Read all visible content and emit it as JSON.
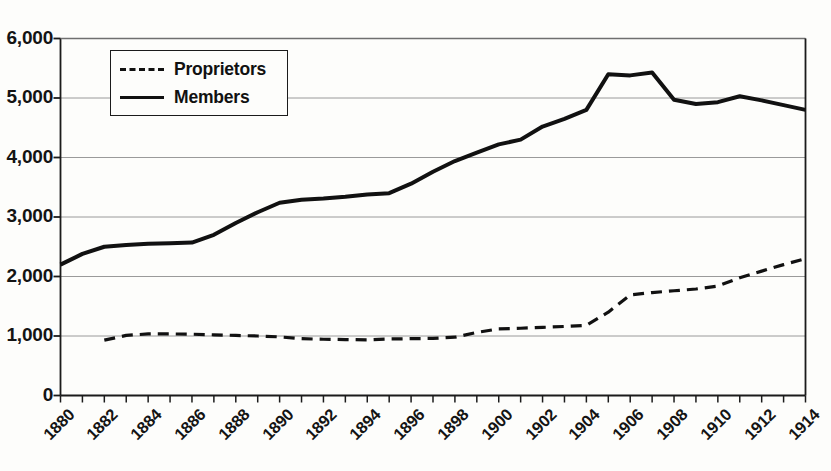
{
  "chart_data": {
    "type": "line",
    "title": "",
    "subtitle": "",
    "xlabel": "",
    "ylabel": "",
    "xlim": [
      1880,
      1914
    ],
    "ylim": [
      0,
      6000
    ],
    "grid": true,
    "grid_axis": "y",
    "legend_position": "upper-left-inside",
    "y_ticks": [
      0,
      1000,
      2000,
      3000,
      4000,
      5000,
      6000
    ],
    "y_tick_labels": [
      "0",
      "1,000",
      "2,000",
      "3,000",
      "4,000",
      "5,000",
      "6,000"
    ],
    "x_ticks": [
      1880,
      1881,
      1882,
      1883,
      1884,
      1885,
      1886,
      1887,
      1888,
      1889,
      1890,
      1891,
      1892,
      1893,
      1894,
      1895,
      1896,
      1897,
      1898,
      1899,
      1900,
      1901,
      1902,
      1903,
      1904,
      1905,
      1906,
      1907,
      1908,
      1909,
      1910,
      1911,
      1912,
      1913,
      1914
    ],
    "x_tick_labels": [
      "1880",
      "1882",
      "1884",
      "1886",
      "1888",
      "1890",
      "1892",
      "1894",
      "1896",
      "1898",
      "1900",
      "1902",
      "1904",
      "1906",
      "1908",
      "1910",
      "1912",
      "1914"
    ],
    "x_labeled_years": [
      1880,
      1882,
      1884,
      1886,
      1888,
      1890,
      1892,
      1894,
      1896,
      1898,
      1900,
      1902,
      1904,
      1906,
      1908,
      1910,
      1912,
      1914
    ],
    "x": [
      1880,
      1881,
      1882,
      1883,
      1884,
      1885,
      1886,
      1887,
      1888,
      1889,
      1890,
      1891,
      1892,
      1893,
      1894,
      1895,
      1896,
      1897,
      1898,
      1899,
      1900,
      1901,
      1902,
      1903,
      1904,
      1905,
      1906,
      1907,
      1908,
      1909,
      1910,
      1911,
      1912,
      1913,
      1914
    ],
    "series": [
      {
        "name": "Proprietors",
        "style": "dashed",
        "color": "#111111",
        "x": [
          1882,
          1883,
          1884,
          1885,
          1886,
          1887,
          1888,
          1889,
          1890,
          1891,
          1892,
          1893,
          1894,
          1895,
          1896,
          1897,
          1898,
          1899,
          1900,
          1901,
          1902,
          1903,
          1904,
          1905,
          1906,
          1907,
          1908,
          1909,
          1910,
          1911,
          1912,
          1913,
          1914
        ],
        "values": [
          930,
          1010,
          1035,
          1035,
          1030,
          1020,
          1010,
          1000,
          985,
          955,
          945,
          940,
          935,
          950,
          955,
          960,
          980,
          1060,
          1120,
          1130,
          1145,
          1160,
          1180,
          1400,
          1690,
          1730,
          1760,
          1790,
          1840,
          1980,
          2090,
          2200,
          2300
        ]
      },
      {
        "name": "Members",
        "style": "solid",
        "color": "#111111",
        "x": [
          1880,
          1881,
          1882,
          1883,
          1884,
          1885,
          1886,
          1887,
          1888,
          1889,
          1890,
          1891,
          1892,
          1893,
          1894,
          1895,
          1896,
          1897,
          1898,
          1899,
          1900,
          1901,
          1902,
          1903,
          1904,
          1905,
          1906,
          1907,
          1908,
          1909,
          1910,
          1911,
          1912,
          1913,
          1914
        ],
        "values": [
          2200,
          2380,
          2500,
          2530,
          2550,
          2560,
          2570,
          2700,
          2900,
          3080,
          3240,
          3290,
          3310,
          3340,
          3380,
          3400,
          3560,
          3760,
          3940,
          4080,
          4220,
          4300,
          4520,
          4650,
          4800,
          5400,
          5380,
          5430,
          4970,
          4900,
          4930,
          5030,
          4960,
          4880,
          4800
        ]
      }
    ]
  },
  "legend": {
    "entries": [
      {
        "label": "Proprietors",
        "style": "dashed"
      },
      {
        "label": "Members",
        "style": "solid"
      }
    ]
  }
}
